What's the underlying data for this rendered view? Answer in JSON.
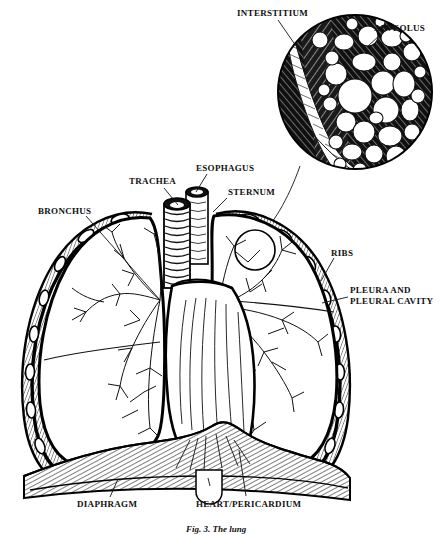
{
  "figure": {
    "style": "black-and-white pen-and-ink line engraving",
    "width": 448,
    "height": 532,
    "background_color": "#ffffff",
    "ink_color": "#000000",
    "caption": "Fig. 3. The lung"
  },
  "labels": [
    {
      "id": "interstitium",
      "text": "INTERSTITIUM",
      "x": 237,
      "y": 8,
      "anchor": "start",
      "leader": {
        "x1": 278,
        "y1": 20,
        "x2": 296,
        "y2": 46
      },
      "points_to": "dark hatched connective tissue band inside magnified circle"
    },
    {
      "id": "alveolus",
      "text": "ALVEOLUS",
      "x": 374,
      "y": 23,
      "anchor": "start",
      "leader": {
        "x1": 381,
        "y1": 34,
        "x2": 367,
        "y2": 47
      },
      "points_to": "white rounded air sacs inside magnified circle"
    },
    {
      "id": "trachea",
      "text": "TRACHEA",
      "x": 129,
      "y": 176,
      "anchor": "start",
      "leader": {
        "x1": 164,
        "y1": 188,
        "x2": 178,
        "y2": 205
      },
      "points_to": "ringed cartilaginous airway tube in midline"
    },
    {
      "id": "esophagus",
      "text": "ESOPHAGUS",
      "x": 196,
      "y": 163,
      "anchor": "start",
      "leader": {
        "x1": 207,
        "y1": 174,
        "x2": 196,
        "y2": 192
      },
      "points_to": "darker muscular tube behind trachea"
    },
    {
      "id": "sternum",
      "text": "STERNUM",
      "x": 228,
      "y": 187,
      "anchor": "start",
      "leader": {
        "x1": 227,
        "y1": 198,
        "x2": 213,
        "y2": 212
      },
      "points_to": "breastbone at front midline of chest"
    },
    {
      "id": "bronchus",
      "text": "BRONCHUS",
      "x": 38,
      "y": 206,
      "anchor": "start",
      "leader": {
        "x1": 86,
        "y1": 216,
        "x2": 160,
        "y2": 300
      },
      "points_to": "branching airway tree within left lung"
    },
    {
      "id": "ribs",
      "text": "RIBS",
      "x": 331,
      "y": 248,
      "anchor": "start",
      "leader": {
        "x1": 334,
        "y1": 258,
        "x2": 321,
        "y2": 281
      },
      "points_to": "oval rib cross-sections along chest wall"
    },
    {
      "id": "pleura-and-pleural-cavity",
      "text": "PLEURA AND\nPLEURAL CAVITY",
      "line1": "PLEURA AND",
      "line2": "PLEURAL CAVITY",
      "x": 350,
      "y": 285,
      "anchor": "start",
      "leader": {
        "x1": 348,
        "y1": 297,
        "x2": 322,
        "y2": 303
      },
      "points_to": "membrane layer and space between lung and chest wall"
    },
    {
      "id": "diaphragm",
      "text": "DIAPHRAGM",
      "x": 77,
      "y": 499,
      "anchor": "start",
      "leader": {
        "x1": 110,
        "y1": 497,
        "x2": 118,
        "y2": 479
      },
      "points_to": "hatched muscular dome beneath the lungs"
    },
    {
      "id": "heart-pericardium",
      "text": "HEART/PERICARDIUM",
      "x": 196,
      "y": 499,
      "anchor": "start",
      "leader": {
        "x1": 246,
        "y1": 496,
        "x2": 239,
        "y2": 450
      },
      "points_to": "central mediastinal mass between the lungs"
    }
  ],
  "structures": {
    "magnified_inset": {
      "name": "alveolar-detail-circle",
      "center_x": 355,
      "center_y": 92,
      "radius": 78,
      "contents": [
        "alveoli",
        "interstitium",
        "bronchiole"
      ]
    },
    "detail_marker": {
      "name": "detail-region-marker-circle",
      "center_x": 255,
      "center_y": 250,
      "radius": 20
    },
    "left_lung": {
      "name": "left-lung",
      "label": "left lung field"
    },
    "right_lung": {
      "name": "right-lung",
      "label": "right lung field"
    },
    "diaphragm": {
      "name": "diaphragm-muscle"
    },
    "trachea": {
      "name": "trachea-tube",
      "ring_count": 17
    }
  }
}
